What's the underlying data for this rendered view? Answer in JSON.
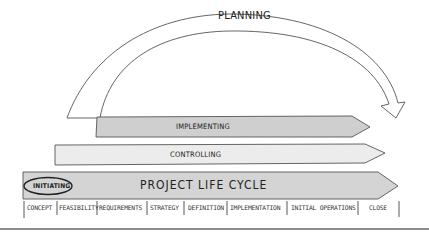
{
  "diagram": {
    "planning": {
      "label": "PLANNING"
    },
    "implementing": {
      "label": "IMPLEMENTING",
      "fill": "#cfcfcf"
    },
    "controlling": {
      "label": "CONTROLLING",
      "fill": "#ececec"
    },
    "life_cycle": {
      "label": "PROJECT LIFE CYCLE",
      "fill": "#d4d4d4",
      "initiating": {
        "label": "INITIATING"
      }
    },
    "phases": [
      {
        "label": "CONCEPT"
      },
      {
        "label": "FEASIBILITY"
      },
      {
        "label": "REQUIREMENTS"
      },
      {
        "label": "STRATEGY"
      },
      {
        "label": "DEFINITION"
      },
      {
        "label": "IMPLEMENTATION"
      },
      {
        "label": "INITIAL OPERATIONS"
      },
      {
        "label": "CLOSE"
      }
    ]
  }
}
